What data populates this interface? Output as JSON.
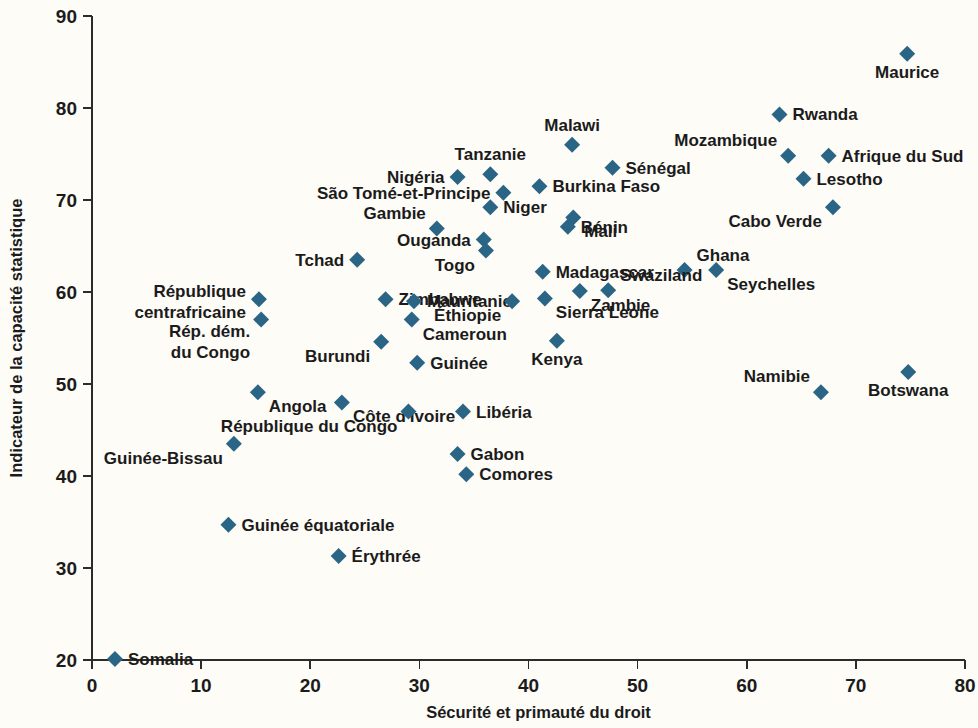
{
  "chart_data": {
    "type": "scatter",
    "title": "",
    "xlabel": "Sécurité et primauté du droit",
    "ylabel": "Indicateur de la capacité statistique",
    "xlim": [
      0,
      80
    ],
    "ylim": [
      20,
      90
    ],
    "xticks": [
      0,
      10,
      20,
      30,
      40,
      50,
      60,
      70,
      80
    ],
    "yticks": [
      20,
      30,
      40,
      50,
      60,
      70,
      80,
      90
    ],
    "xtick_labels": [
      "0",
      "10",
      "20",
      "30",
      "40",
      "50",
      "60",
      "70",
      "80"
    ],
    "ytick_labels": [
      "20",
      "30",
      "40",
      "50",
      "60",
      "70",
      "80",
      "90"
    ],
    "grid": false,
    "legend": null,
    "marker_shape": "diamond",
    "marker_color": "#2b6585",
    "background_color": "#fdfcf7",
    "points": [
      {
        "label": "Maurice",
        "x": 74.7,
        "y": 85.9,
        "label_pos": "below"
      },
      {
        "label": "Rwanda",
        "x": 63.0,
        "y": 79.3,
        "label_pos": "right"
      },
      {
        "label": "Malawi",
        "x": 44.0,
        "y": 76.0,
        "label_pos": "above"
      },
      {
        "label": "Mozambique",
        "x": 63.8,
        "y": 74.8,
        "label_pos": "above-left"
      },
      {
        "label": "Afrique du Sud",
        "x": 67.5,
        "y": 74.8,
        "label_pos": "right"
      },
      {
        "label": "Sénégal",
        "x": 47.7,
        "y": 73.5,
        "label_pos": "right"
      },
      {
        "label": "Tanzanie",
        "x": 36.5,
        "y": 72.8,
        "label_pos": "above"
      },
      {
        "label": "Nigéria",
        "x": 33.5,
        "y": 72.5,
        "label_pos": "left"
      },
      {
        "label": "Lesotho",
        "x": 65.2,
        "y": 72.3,
        "label_pos": "right"
      },
      {
        "label": "Burkina Faso",
        "x": 41.0,
        "y": 71.5,
        "label_pos": "right"
      },
      {
        "label": "São Tomé-et-Principe",
        "x": 37.7,
        "y": 70.8,
        "label_pos": "left"
      },
      {
        "label": "Cabo Verde",
        "x": 67.9,
        "y": 69.2,
        "label_pos": "below-left"
      },
      {
        "label": "Niger",
        "x": 36.5,
        "y": 69.2,
        "label_pos": "right"
      },
      {
        "label": "Mali",
        "x": 44.1,
        "y": 68.1,
        "label_pos": "below-right"
      },
      {
        "label": "Gambie",
        "x": 31.6,
        "y": 66.9,
        "label_pos": "above-left"
      },
      {
        "label": "Bénin",
        "x": 43.6,
        "y": 67.1,
        "label_pos": "right"
      },
      {
        "label": "Ouganda",
        "x": 35.9,
        "y": 65.7,
        "label_pos": "left"
      },
      {
        "label": "Tchad",
        "x": 24.3,
        "y": 63.5,
        "label_pos": "left"
      },
      {
        "label": "Ghana",
        "x": 54.3,
        "y": 62.4,
        "label_pos": "above-right"
      },
      {
        "label": "Seychelles",
        "x": 57.2,
        "y": 62.4,
        "label_pos": "below-right"
      },
      {
        "label": "Togo",
        "x": 36.1,
        "y": 64.5,
        "label_pos": "below-left"
      },
      {
        "label": "Madagascar",
        "x": 41.3,
        "y": 62.2,
        "label_pos": "right"
      },
      {
        "label": "Swaziland",
        "x": 47.3,
        "y": 60.2,
        "label_pos": "above-right"
      },
      {
        "label": "Zambie",
        "x": 44.7,
        "y": 60.1,
        "label_pos": "below-right"
      },
      {
        "label": "République centrafricaine",
        "x": 15.3,
        "y": 59.2,
        "label_pos": "left"
      },
      {
        "label": "Zimbabwe",
        "x": 26.9,
        "y": 59.2,
        "label_pos": "right"
      },
      {
        "label": "Mauritanie",
        "x": 29.5,
        "y": 59.0,
        "label_pos": "right"
      },
      {
        "label": "Éthiopie",
        "x": 38.5,
        "y": 59.0,
        "label_pos": "below-left"
      },
      {
        "label": "Rép. dém. du Congo",
        "x": 15.5,
        "y": 57.0,
        "label_pos": "below-left"
      },
      {
        "label": "Cameroun",
        "x": 29.3,
        "y": 57.0,
        "label_pos": "below-right"
      },
      {
        "label": "Sierra Leone",
        "x": 41.5,
        "y": 59.3,
        "label_pos": "below-right"
      },
      {
        "label": "Burundi",
        "x": 26.5,
        "y": 54.6,
        "label_pos": "below-left"
      },
      {
        "label": "Kenya",
        "x": 42.6,
        "y": 54.7,
        "label_pos": "below"
      },
      {
        "label": "Guinée",
        "x": 29.8,
        "y": 52.3,
        "label_pos": "right"
      },
      {
        "label": "Botswana",
        "x": 74.8,
        "y": 51.3,
        "label_pos": "below"
      },
      {
        "label": "Angola",
        "x": 15.2,
        "y": 49.1,
        "label_pos": "below-right"
      },
      {
        "label": "Namibie",
        "x": 66.8,
        "y": 49.1,
        "label_pos": "above-left"
      },
      {
        "label": "Côte d'Ivoire",
        "x": 22.9,
        "y": 48.0,
        "label_pos": "below-right"
      },
      {
        "label": "République du Congo",
        "x": 29.0,
        "y": 47.0,
        "label_pos": "below-left"
      },
      {
        "label": "Libéria",
        "x": 34.0,
        "y": 47.0,
        "label_pos": "right"
      },
      {
        "label": "Guinée-Bissau",
        "x": 13.0,
        "y": 43.5,
        "label_pos": "below-left"
      },
      {
        "label": "Gabon",
        "x": 33.5,
        "y": 42.4,
        "label_pos": "right"
      },
      {
        "label": "Comores",
        "x": 34.3,
        "y": 40.2,
        "label_pos": "right"
      },
      {
        "label": "Guinée équatoriale",
        "x": 12.5,
        "y": 34.7,
        "label_pos": "right"
      },
      {
        "label": "Érythrée",
        "x": 22.6,
        "y": 31.3,
        "label_pos": "right"
      },
      {
        "label": "Somalia",
        "x": 2.1,
        "y": 20.1,
        "label_pos": "right"
      }
    ]
  }
}
